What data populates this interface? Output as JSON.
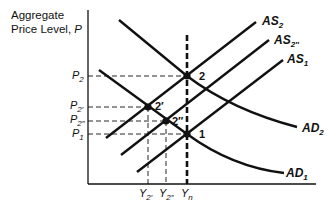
{
  "diagram": {
    "y_axis_title_line1": "Aggregate",
    "y_axis_title_line2": "Price Level, ",
    "y_axis_symbol": "P",
    "curves": {
      "AS2": {
        "base": "AS",
        "sub": "2"
      },
      "AS2pp": {
        "base": "AS",
        "sub": "2″"
      },
      "AS1": {
        "base": "AS",
        "sub": "1"
      },
      "AD2": {
        "base": "AD",
        "sub": "2"
      },
      "AD1": {
        "base": "AD",
        "sub": "1"
      }
    },
    "points": {
      "p2": "2",
      "p2p": "2′",
      "p2pp": "2″",
      "p1": "1"
    },
    "price_ticks": {
      "P2": {
        "base": "P",
        "sub": "2"
      },
      "P2p": {
        "base": "P",
        "sub": "2′"
      },
      "P2pp": {
        "base": "P",
        "sub": "2″"
      },
      "P1": {
        "base": "P",
        "sub": "1"
      }
    },
    "output_ticks": {
      "Y2p": {
        "base": "Y",
        "sub": "2′"
      },
      "Y2pp": {
        "base": "Y",
        "sub": "2″"
      },
      "Yn": {
        "base": "Y",
        "sub": "n"
      }
    },
    "colors": {
      "ink": "#111111",
      "background": "#ffffff"
    }
  }
}
